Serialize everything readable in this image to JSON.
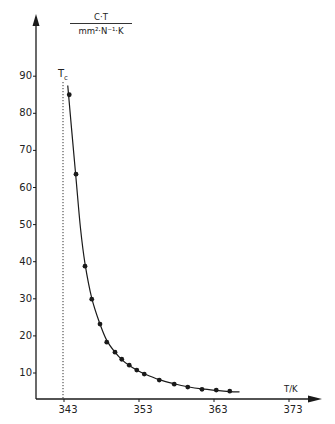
{
  "chart_data": {
    "type": "scatter",
    "title": "",
    "xlabel": "T/K",
    "ylabel_numerator": "C·T",
    "ylabel_denominator": "mm²·N⁻¹·K",
    "ylabel": "C·T / mm²·N⁻¹·K",
    "annotation": "Tc",
    "Tc": 341.9,
    "xlim": [
      339.5,
      377
    ],
    "ylim": [
      3,
      95
    ],
    "x_ticks": [
      343,
      353,
      363,
      373
    ],
    "y_ticks": [
      10,
      20,
      30,
      40,
      50,
      60,
      70,
      80,
      90
    ],
    "grid": false,
    "legend": null,
    "series": [
      {
        "name": "measured",
        "marker": "filled-circle",
        "x": [
          343.7,
          344.6,
          345.8,
          346.7,
          347.8,
          348.7,
          349.8,
          350.7,
          351.7,
          352.7,
          353.7,
          355.7,
          357.7,
          359.5,
          361.4,
          363.3,
          365.1
        ],
        "y": [
          85.0,
          63.6,
          38.8,
          29.9,
          23.2,
          18.3,
          15.6,
          13.7,
          12.1,
          10.8,
          9.7,
          8.1,
          7.0,
          6.2,
          5.6,
          5.4,
          5.1
        ]
      },
      {
        "name": "fit-curve",
        "marker": "line",
        "x": [
          343.5,
          344.0,
          344.6,
          345.2,
          345.8,
          346.7,
          347.8,
          348.7,
          349.8,
          350.7,
          351.7,
          352.7,
          353.7,
          355.7,
          357.7,
          359.5,
          361.4,
          363.3,
          365.1,
          366.4
        ],
        "y": [
          87.5,
          76.0,
          62.5,
          49.0,
          39.5,
          30.2,
          23.2,
          18.8,
          15.6,
          13.6,
          12.0,
          10.8,
          9.8,
          8.2,
          7.1,
          6.3,
          5.7,
          5.3,
          5.0,
          4.9
        ]
      }
    ]
  },
  "labels": {
    "unit_numerator": "C·T",
    "unit_denominator": "mm²·N⁻¹·K",
    "tc_main": "T",
    "tc_sub": "c",
    "x_axis_name": "T/K",
    "y_ticks": [
      "90",
      "80",
      "70",
      "60",
      "50",
      "40",
      "30",
      "20",
      "10"
    ],
    "x_ticks": [
      "343",
      "353",
      "363",
      "373"
    ]
  },
  "colors": {
    "ink": "#1a1a1a",
    "background": "#ffffff"
  }
}
